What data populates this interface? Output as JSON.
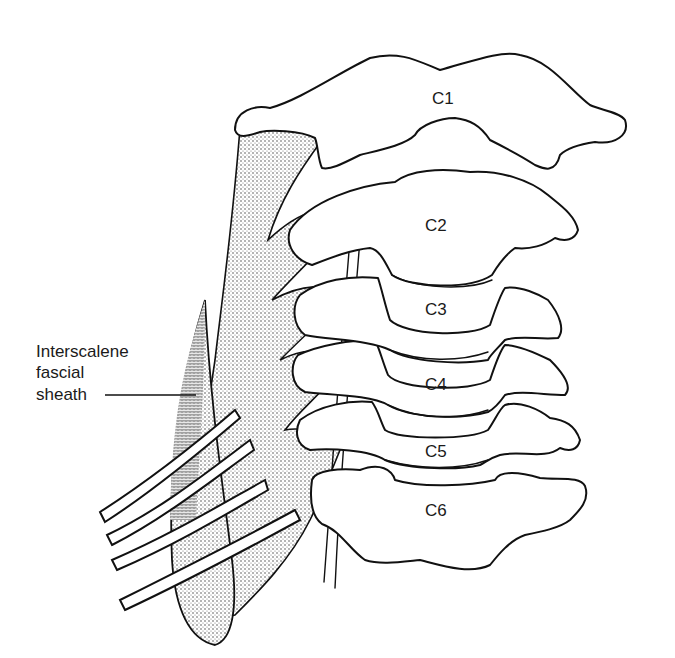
{
  "figure": {
    "type": "anatomical line drawing",
    "colors": {
      "ink": "#111111",
      "background": "#ffffff",
      "stipple": "#6b6b6b"
    }
  },
  "vertebrae": [
    {
      "label": "C1"
    },
    {
      "label": "C2"
    },
    {
      "label": "C3"
    },
    {
      "label": "C4"
    },
    {
      "label": "C5"
    },
    {
      "label": "C6"
    }
  ],
  "callouts": {
    "sheath": {
      "line1": "Interscalene",
      "line2": "fascial",
      "line3": "sheath"
    }
  }
}
